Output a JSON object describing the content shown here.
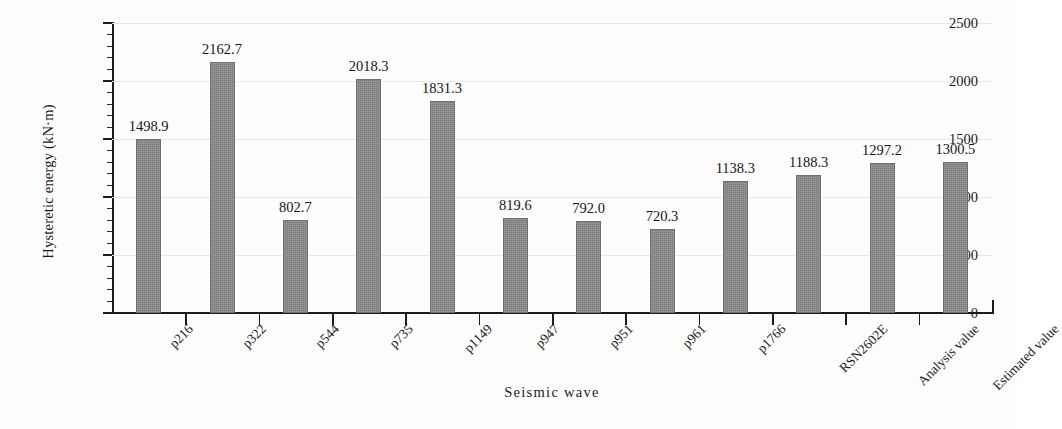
{
  "chart_data": {
    "type": "bar",
    "title": "",
    "xlabel": "Seismic wave",
    "ylabel": "Hysteretic energy (kN·m)",
    "categories": [
      "p216",
      "p322",
      "p544",
      "p735",
      "p1149",
      "p947",
      "p951",
      "p961",
      "p1766",
      "RSN2602E",
      "Analysis value",
      "Estimated value"
    ],
    "values": [
      1498.9,
      2162.7,
      802.7,
      2018.3,
      1831.3,
      819.6,
      792.0,
      720.3,
      1138.3,
      1188.3,
      1297.2,
      1300.5
    ],
    "value_labels": [
      "1498.9",
      "2162.7",
      "802.7",
      "2018.3",
      "1831.3",
      "819.6",
      "792.0",
      "720.3",
      "1138.3",
      "1188.3",
      "1297.2",
      "1300.5"
    ],
    "ylim": [
      0,
      2500
    ],
    "ytick_labels": [
      "0",
      "500",
      "1000",
      "1500",
      "2000",
      "2500"
    ],
    "ytick_values": [
      0,
      500,
      1000,
      1500,
      2000,
      2500
    ],
    "yminor_step": 100,
    "grid": true,
    "legend": null,
    "bar_color": "#858585",
    "grid_color": "#e8e8e8",
    "axis_color": "#1c1c1c",
    "text_color": "#1a1a1a"
  }
}
